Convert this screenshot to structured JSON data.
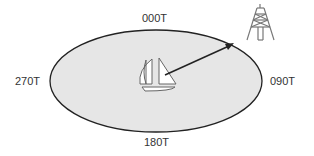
{
  "diagram": {
    "labels": {
      "north": "000T",
      "east": "090T",
      "south": "180T",
      "west": "270T"
    },
    "colors": {
      "ellipse_fill": "#e6e6e6",
      "ellipse_stroke": "#222222",
      "arrow": "#222222",
      "icon_stroke": "#777777"
    },
    "icons": {
      "center": "sailboat-icon",
      "target": "radio-tower-icon"
    }
  }
}
